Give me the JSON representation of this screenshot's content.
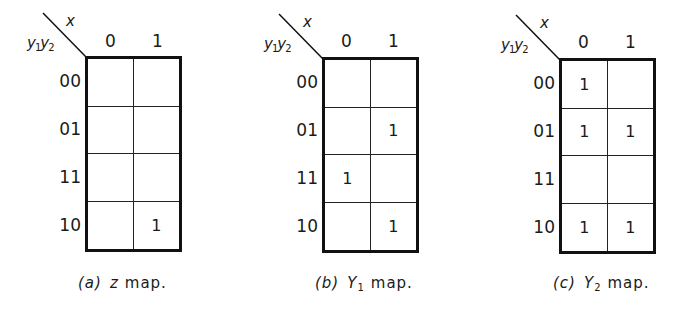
{
  "figure": {
    "column_variable": "x",
    "row_variables": {
      "first": "y",
      "first_sub": "1",
      "second": "y",
      "second_sub": "2"
    },
    "column_labels": [
      "0",
      "1"
    ],
    "row_labels": [
      "00",
      "01",
      "11",
      "10"
    ]
  },
  "maps": [
    {
      "id": "a",
      "caption": {
        "label": "(a)",
        "function": "z",
        "function_sub": "",
        "word": "map."
      },
      "cells": [
        [
          "",
          ""
        ],
        [
          "",
          ""
        ],
        [
          "",
          ""
        ],
        [
          "",
          "1"
        ]
      ]
    },
    {
      "id": "b",
      "caption": {
        "label": "(b)",
        "function": "Y",
        "function_sub": "1",
        "word": "map."
      },
      "cells": [
        [
          "",
          ""
        ],
        [
          "",
          "1"
        ],
        [
          "1",
          ""
        ],
        [
          "",
          "1"
        ]
      ]
    },
    {
      "id": "c",
      "caption": {
        "label": "(c)",
        "function": "Y",
        "function_sub": "2",
        "word": "map."
      },
      "cells": [
        [
          "1",
          ""
        ],
        [
          "1",
          "1"
        ],
        [
          "",
          ""
        ],
        [
          "1",
          "1"
        ]
      ]
    }
  ]
}
